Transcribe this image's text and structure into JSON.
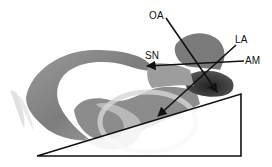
{
  "figure": {
    "labels": {
      "oa": "OA",
      "la": "LA",
      "sn": "SN",
      "am": "AM"
    },
    "colors": {
      "line": "#111111",
      "structure_light": "#c8c8c8",
      "structure_mid": "#8a8a8a",
      "structure_dark": "#3a3a3a",
      "background": "#ffffff"
    }
  }
}
